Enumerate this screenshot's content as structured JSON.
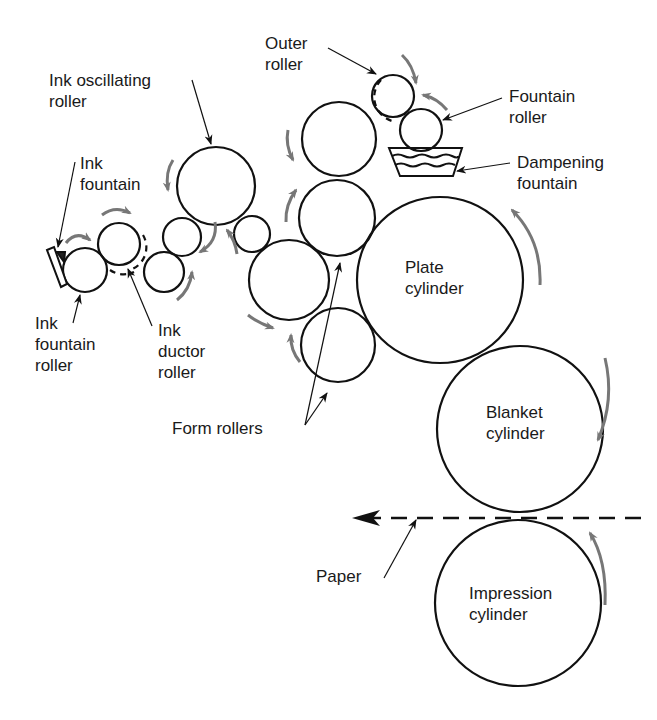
{
  "labels": {
    "outer_roller": "Outer\nroller",
    "ink_oscillating_roller": "Ink oscillating\nroller",
    "fountain_roller": "Fountain\nroller",
    "ink_fountain": "Ink\nfountain",
    "dampening_fountain": "Dampening\nfountain",
    "plate_cylinder": "Plate\ncylinder",
    "ink_fountain_roller": "Ink\nfountain\nroller",
    "ink_ductor_roller": "Ink\nductor\nroller",
    "form_rollers": "Form rollers",
    "blanket_cylinder": "Blanket\ncylinder",
    "paper": "Paper",
    "impression_cylinder": "Impression\ncylinder"
  },
  "colors": {
    "stroke": "#111111",
    "arrow_gray": "#777777"
  }
}
